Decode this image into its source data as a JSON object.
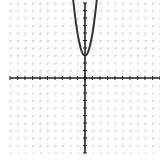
{
  "chart_data": {
    "type": "line",
    "title": "",
    "xlabel": "",
    "ylabel": "",
    "xlim": [
      -10,
      10
    ],
    "ylim": [
      -10,
      10
    ],
    "grid": true,
    "grid_style": "dashed tick-mark grid",
    "series": [
      {
        "name": "y = 3x^2 + 3",
        "function": "3*x*x+3",
        "vertex": [
          0,
          3
        ],
        "color": "#333333"
      }
    ]
  },
  "colors": {
    "axis": "#222222",
    "grid": "#c8c8c8",
    "curve": "#333333",
    "background": "#ffffff"
  }
}
